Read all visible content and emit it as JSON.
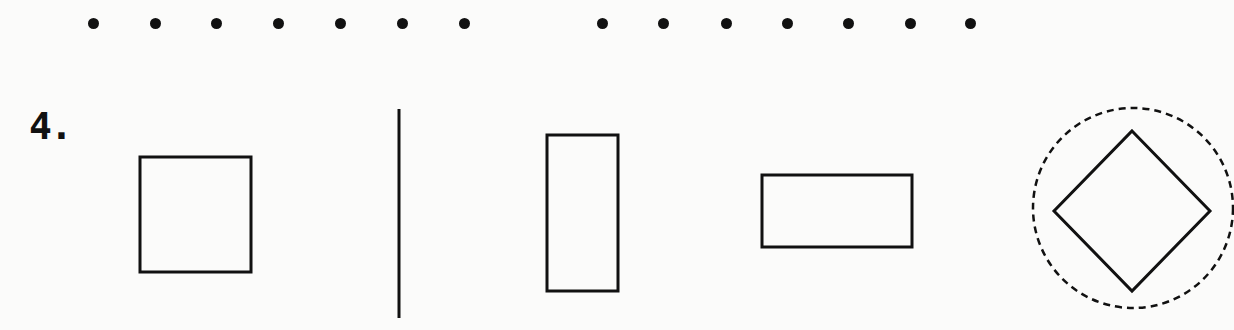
{
  "worksheet": {
    "problem_number": "4.",
    "dot_row": {
      "y": 23,
      "left_group_x": [
        93,
        155,
        216,
        278,
        340,
        402,
        464
      ],
      "right_group_x": [
        602,
        663,
        726,
        787,
        848,
        910,
        970
      ]
    },
    "shapes": [
      {
        "name": "square",
        "x": 140,
        "y": 157,
        "w": 111,
        "h": 115
      },
      {
        "name": "vertical-line",
        "x": 399,
        "y1": 109,
        "y2": 318
      },
      {
        "name": "tall-rectangle",
        "x": 547,
        "y": 135,
        "w": 71,
        "h": 156
      },
      {
        "name": "wide-rectangle",
        "x": 762,
        "y": 175,
        "w": 150,
        "h": 72
      },
      {
        "name": "diamond",
        "cx": 1132,
        "cy": 211,
        "rx": 78,
        "ry": 80
      },
      {
        "name": "dashed-circle",
        "cx": 1133,
        "cy": 208,
        "r": 100
      }
    ],
    "colors": {
      "ink": "#111111",
      "paper": "#fbfbfa"
    }
  }
}
